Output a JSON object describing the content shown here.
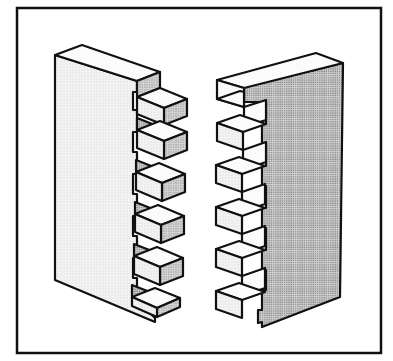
{
  "figure": {
    "frame": {
      "x": 17,
      "y": 8,
      "width": 364,
      "height": 345
    },
    "colors": {
      "stroke": "#111111",
      "background": "#ffffff",
      "face_light": "#ececec",
      "face_white": "#fbfbfb",
      "face_stipple": "#bdbdbd"
    },
    "left_board": {
      "label": "left-board",
      "finger_count": 6,
      "finger_direction": "right"
    },
    "right_board": {
      "label": "right-board",
      "finger_count": 6,
      "finger_direction": "left"
    }
  }
}
